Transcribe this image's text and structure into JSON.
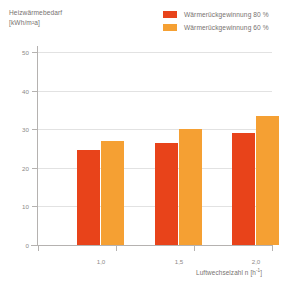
{
  "chart_data": {
    "type": "bar",
    "title": "",
    "ylabel": "Heizwärmebedarf",
    "yunit": "[kWh/m²a]",
    "xlabel": "Luftwechselzahl n [h⁻¹]",
    "categories": [
      "1,0",
      "1,5",
      "2,0"
    ],
    "yticks": [
      0,
      10,
      20,
      30,
      40,
      50
    ],
    "ytick_labels": [
      "0",
      "10",
      "20",
      "30",
      "40",
      "50"
    ],
    "ylim": [
      0,
      50
    ],
    "grid": true,
    "legend_position": "top-right",
    "series": [
      {
        "name": "Wärmerückgewinnung 80 %",
        "color": "#e8431a",
        "values": [
          24.5,
          26.5,
          29
        ]
      },
      {
        "name": "Wärmerückgewinnung 60 %",
        "color": "#f5a033",
        "values": [
          27,
          30,
          33.5
        ]
      }
    ]
  },
  "axis": {
    "y_title_line1": "Heizwärmebedarf",
    "y_title_line2": "[kWh/m²a]",
    "x_title_main": "Luftwechselzahl n [h",
    "x_title_sup": "-1",
    "x_title_tail": "]"
  }
}
